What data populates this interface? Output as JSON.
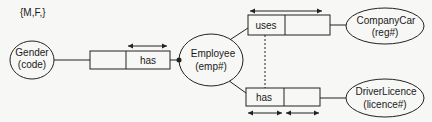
{
  "diagram": {
    "type": "ORM fact-type diagram",
    "entities": [
      {
        "id": "gender",
        "name": "Gender",
        "ref": "(code)",
        "constraint": "{M,F,}"
      },
      {
        "id": "employee",
        "name": "Employee",
        "ref": "(emp#)"
      },
      {
        "id": "companycar",
        "name": "CompanyCar",
        "ref": "(reg#)"
      },
      {
        "id": "driverlicence",
        "name": "DriverLicence",
        "ref": "(licence#)"
      }
    ],
    "facts": [
      {
        "id": "employee-has-gender",
        "role_label": "has",
        "between": [
          "gender",
          "employee"
        ],
        "uniqueness": "right role",
        "mandatory": "employee"
      },
      {
        "id": "employee-uses-car",
        "role_label": "uses",
        "between": [
          "employee",
          "companycar"
        ],
        "uniqueness": "spanning both roles"
      },
      {
        "id": "employee-has-licence",
        "role_label": "has",
        "between": [
          "employee",
          "driverlicence"
        ],
        "uniqueness": "each role separately"
      }
    ],
    "subset_constraint": {
      "from": "employee-uses-car",
      "to": "employee-has-licence",
      "style": "dashed"
    }
  },
  "colors": {
    "stroke": "#222222",
    "background": "#f7f7f5"
  }
}
